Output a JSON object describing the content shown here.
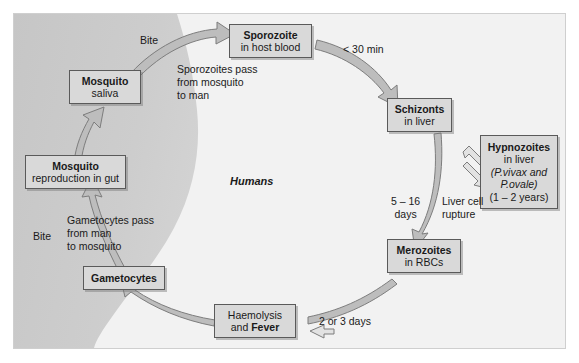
{
  "diagram": {
    "region_label": "Humans",
    "colors": {
      "frame_bg": "#f2f2f2",
      "mosquito_zone": "#c9c9c9",
      "node_fill": "#d9d9d9",
      "node_border": "#5a5a5a",
      "arrow_fill": "#b5b5b5",
      "arrow_stroke": "#6e6e6e"
    },
    "nodes": [
      {
        "id": "sporozoite",
        "lines": [
          {
            "text": "Sporozoite",
            "style": "bold"
          },
          {
            "text": "in host blood",
            "style": "normal"
          }
        ],
        "x": 228,
        "y": 23,
        "w": 83,
        "h": 34
      },
      {
        "id": "mosquito-saliva",
        "lines": [
          {
            "text": "Mosquito",
            "style": "bold"
          },
          {
            "text": "saliva",
            "style": "normal"
          }
        ],
        "x": 68,
        "y": 69,
        "w": 72,
        "h": 34
      },
      {
        "id": "schizonts",
        "lines": [
          {
            "text": "Schizonts",
            "style": "bold"
          },
          {
            "text": "in liver",
            "style": "normal"
          }
        ],
        "x": 386,
        "y": 97,
        "w": 65,
        "h": 34
      },
      {
        "id": "hypnozoites",
        "lines": [
          {
            "text": "Hypnozoites",
            "style": "bold"
          },
          {
            "text": "in liver",
            "style": "normal"
          },
          {
            "text": "(P.vivax and",
            "style": "italic-mixed"
          },
          {
            "text": "P.ovale)",
            "style": "italic-mixed"
          },
          {
            "text": "(1 – 2 years)",
            "style": "normal"
          }
        ],
        "x": 479,
        "y": 134,
        "w": 78,
        "h": 74
      },
      {
        "id": "mosquito-reproduction",
        "lines": [
          {
            "text": "Mosquito",
            "style": "bold"
          },
          {
            "text": "reproduction in gut",
            "style": "normal"
          }
        ],
        "x": 24,
        "y": 154,
        "w": 101,
        "h": 34
      },
      {
        "id": "merozoites",
        "lines": [
          {
            "text": "Merozoites",
            "style": "bold"
          },
          {
            "text": "in RBCs",
            "style": "normal"
          }
        ],
        "x": 386,
        "y": 238,
        "w": 74,
        "h": 34
      },
      {
        "id": "gametocytes",
        "lines": [
          {
            "text": "Gametocytes",
            "style": "bold"
          }
        ],
        "x": 82,
        "y": 265,
        "w": 82,
        "h": 24
      },
      {
        "id": "haemolysis-fever",
        "lines": [
          {
            "text": "Haemolysis",
            "style": "normal"
          },
          {
            "text": "and Fever",
            "style": "normal-bold-tail"
          }
        ],
        "x": 213,
        "y": 303,
        "w": 82,
        "h": 34
      }
    ],
    "edge_labels": [
      {
        "id": "bite-top",
        "text": "Bite",
        "x": 139,
        "y": 33
      },
      {
        "id": "sporozoites-pass",
        "text": "Sporozoites pass\nfrom mosquito\nto man",
        "x": 176,
        "y": 62
      },
      {
        "id": "under-30-min",
        "text": "< 30 min",
        "x": 342,
        "y": 42
      },
      {
        "id": "five-to-16-days",
        "text": "5 – 16\ndays",
        "x": 390,
        "y": 194
      },
      {
        "id": "liver-cell-rupture",
        "text": "Liver cell\nrupture",
        "x": 441,
        "y": 194
      },
      {
        "id": "two-or-three-days",
        "text": "2 or 3 days",
        "x": 318,
        "y": 314
      },
      {
        "id": "gametocytes-pass",
        "text": "Gametocytes pass\nfrom man\nto mosquito",
        "x": 66,
        "y": 213
      },
      {
        "id": "bite-bottom",
        "text": "Bite",
        "x": 32,
        "y": 229
      }
    ]
  }
}
